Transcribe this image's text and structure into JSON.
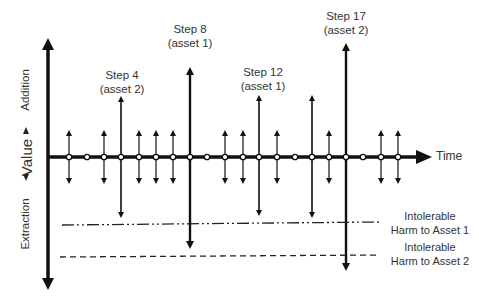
{
  "axes": {
    "y_label": "Value",
    "y_positive_label": "Addition",
    "y_negative_label": "Extraction",
    "x_label": "Time"
  },
  "step_labels": [
    {
      "step": "Step 4",
      "asset": "(asset 2)"
    },
    {
      "step": "Step 8",
      "asset": "(asset 1)"
    },
    {
      "step": "Step 12",
      "asset": "(asset 1)"
    },
    {
      "step": "Step 17",
      "asset": "(asset 2)"
    }
  ],
  "thresholds": [
    {
      "line1": "Intolerable",
      "line2": "Harm to Asset 1",
      "style": "dash-dot"
    },
    {
      "line1": "Intolerable",
      "line2": "Harm to Asset 2",
      "style": "dashed"
    }
  ],
  "timeline": {
    "node_count": 20,
    "nodes": [
      {
        "index": 1,
        "type": "small"
      },
      {
        "index": 2,
        "type": "none"
      },
      {
        "index": 3,
        "type": "small"
      },
      {
        "index": 4,
        "type": "large",
        "label": "Step 4 (asset 2)"
      },
      {
        "index": 5,
        "type": "small"
      },
      {
        "index": 6,
        "type": "small"
      },
      {
        "index": 7,
        "type": "small"
      },
      {
        "index": 8,
        "type": "large",
        "label": "Step 8 (asset 1)"
      },
      {
        "index": 9,
        "type": "none"
      },
      {
        "index": 10,
        "type": "small"
      },
      {
        "index": 11,
        "type": "small"
      },
      {
        "index": 12,
        "type": "large",
        "label": "Step 12 (asset 1)"
      },
      {
        "index": 13,
        "type": "small"
      },
      {
        "index": 14,
        "type": "none"
      },
      {
        "index": 15,
        "type": "large"
      },
      {
        "index": 16,
        "type": "small"
      },
      {
        "index": 17,
        "type": "large",
        "label": "Step 17 (asset 2)"
      },
      {
        "index": 18,
        "type": "none"
      },
      {
        "index": 19,
        "type": "small"
      },
      {
        "index": 20,
        "type": "small"
      }
    ]
  }
}
